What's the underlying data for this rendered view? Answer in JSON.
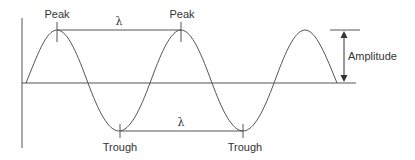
{
  "diagram": {
    "type": "wave-anatomy",
    "labels": {
      "peak_1": "Peak",
      "peak_2": "Peak",
      "trough_1": "Trough",
      "trough_2": "Trough",
      "wavelength_top": "λ",
      "wavelength_bottom": "λ",
      "amplitude": "Amplitude"
    },
    "colors": {
      "line": "#555555",
      "text": "#333333",
      "background": "#ffffff"
    }
  }
}
